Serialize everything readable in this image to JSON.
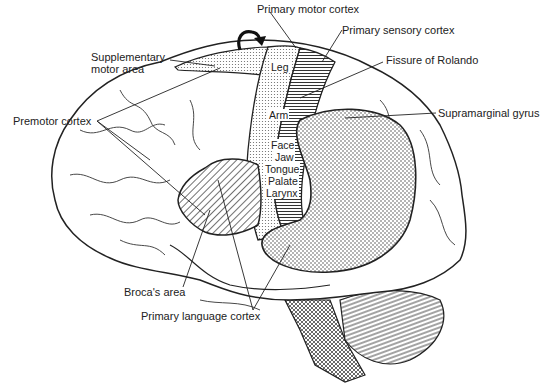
{
  "diagram": {
    "type": "anatomical-illustration",
    "labels": {
      "primary_motor_cortex": "Primary motor cortex",
      "primary_sensory_cortex": "Primary sensory cortex",
      "supplementary_motor_area": [
        "Supplementary",
        "motor area"
      ],
      "fissure_of_rolando": "Fissure of Rolando",
      "premotor_cortex": "Premotor cortex",
      "supramarginal_gyrus": "Supramarginal gyrus",
      "brocas_area": "Broca's area",
      "primary_language_cortex": "Primary language cortex"
    },
    "motor_strip_labels": {
      "leg": "Leg",
      "arm": "Arm",
      "face": "Face",
      "jaw": "Jaw",
      "tongue": "Tongue",
      "palate": "Palate",
      "larynx": "Larynx"
    },
    "colors": {
      "ink": "#222222",
      "background": "#ffffff",
      "stipple_fill": "#d8d8d8"
    }
  }
}
